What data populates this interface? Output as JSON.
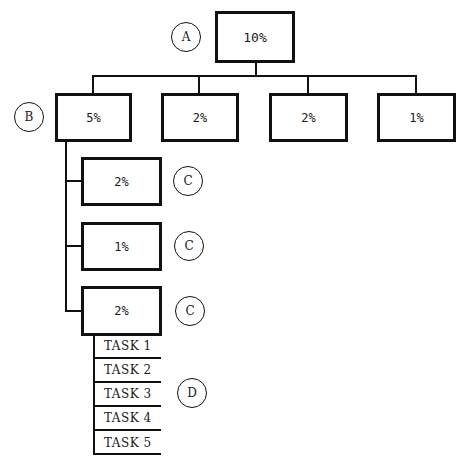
{
  "root": {
    "label": "A",
    "value": "10%"
  },
  "level1": {
    "label": "B",
    "boxes": [
      {
        "value": "5%"
      },
      {
        "value": "2%"
      },
      {
        "value": "2%"
      },
      {
        "value": "1%"
      }
    ]
  },
  "level2": {
    "label": "C",
    "boxes": [
      {
        "value": "2%"
      },
      {
        "value": "1%"
      },
      {
        "value": "2%"
      }
    ]
  },
  "tasks": {
    "label": "D",
    "items": [
      "TASK 1",
      "TASK 2",
      "TASK 3",
      "TASK 4",
      "TASK 5"
    ]
  }
}
